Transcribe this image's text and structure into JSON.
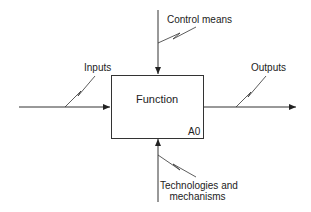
{
  "diagram": {
    "type": "IDEF0",
    "function_box": {
      "title": "Function",
      "node_id": "A0"
    },
    "arrows": {
      "control": {
        "label": "Control means"
      },
      "input": {
        "label": "Inputs"
      },
      "output": {
        "label": "Outputs"
      },
      "mechanism": {
        "label_line1": "Technologies and",
        "label_line2": "mechanisms"
      }
    },
    "colors": {
      "line": "#333333",
      "background": "#ffffff"
    }
  }
}
